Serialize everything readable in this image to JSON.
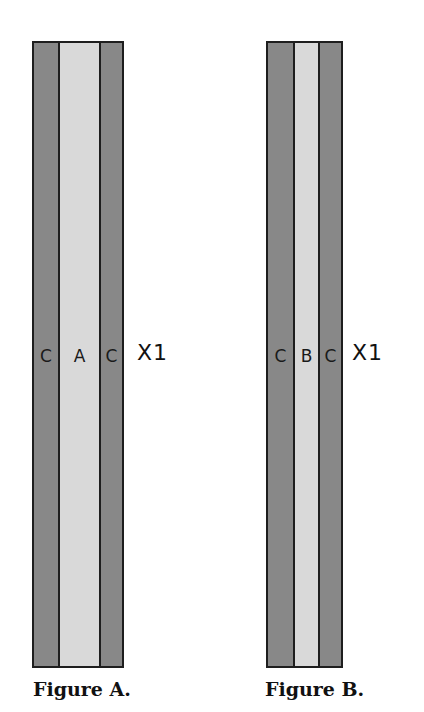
{
  "colors": {
    "dark_strip": "#888888",
    "light_strip": "#d9d9d9",
    "outline": "#1e1e1e"
  },
  "figures": [
    {
      "caption": "Figure A.",
      "multiplier": "X1",
      "strips": [
        {
          "label": "C",
          "shade": "dark"
        },
        {
          "label": "A",
          "shade": "light"
        },
        {
          "label": "C",
          "shade": "dark"
        }
      ]
    },
    {
      "caption": "Figure B.",
      "multiplier": "X1",
      "strips": [
        {
          "label": "C",
          "shade": "dark"
        },
        {
          "label": "B",
          "shade": "light"
        },
        {
          "label": "C",
          "shade": "dark"
        }
      ]
    }
  ]
}
